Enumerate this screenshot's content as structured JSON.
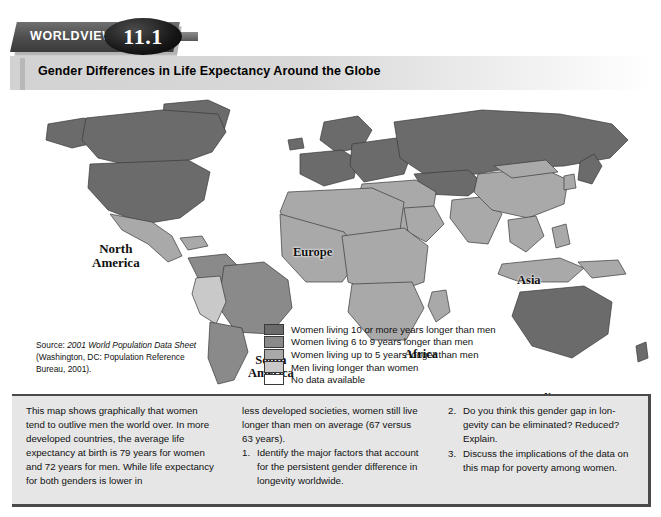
{
  "header": {
    "kicker": "WORLDVIEW",
    "number": "11.1",
    "title": "Gender Differences in Life Expectancy Around the Globe"
  },
  "map": {
    "labels": [
      {
        "name": "north-america",
        "text": "North\nAmerica"
      },
      {
        "name": "south-america",
        "text": "South\nAmerica"
      },
      {
        "name": "europe",
        "text": "Europe"
      },
      {
        "name": "africa",
        "text": "Africa"
      },
      {
        "name": "asia",
        "text": "Asia"
      },
      {
        "name": "australia",
        "text": "Australia"
      }
    ],
    "colors": {
      "darkest": "#6b6b6b",
      "dark": "#8a8a8a",
      "medium": "#a9a9a9",
      "light": "#c9c9c9",
      "none": "#ffffff",
      "outline": "#3a3a3a",
      "ocean": "#ffffff"
    }
  },
  "legend": {
    "items": [
      {
        "swatch": "#6b6b6b",
        "label": "Women living 10 or more years longer than men"
      },
      {
        "swatch": "#8a8a8a",
        "label": "Women living 6 to 9 years longer than men"
      },
      {
        "swatch": "#a9a9a9",
        "label": "Women living up to 5 years longer than men"
      },
      {
        "swatch": "#c9c9c9",
        "label": "Men living longer than women"
      },
      {
        "swatch": "#ffffff",
        "label": "No data available"
      }
    ]
  },
  "source": {
    "prefix": "Source: ",
    "italic": "2001 World Population Data Sheet",
    "rest": " (Washington, DC: Population Reference Bureau, 2001)."
  },
  "bottom": {
    "column1": "This map shows graphically that women tend to outlive men the world over. In more developed countries, the average life expectancy at birth is 79 years for women and 72 years for men. While life expectancy for both genders is lower in",
    "column2_intro": "less developed societies, women still live longer than men on average (67 versus 63 years).",
    "questions": [
      {
        "num": "1.",
        "text": "Identify the major factors that account for the persistent gender difference in longevity worldwide."
      },
      {
        "num": "2.",
        "text": "Do you think this gender gap in lon-gevity can be eliminated? Reduced? Explain."
      },
      {
        "num": "3.",
        "text": "Discuss the implications of the data on this map for poverty among women."
      }
    ]
  }
}
